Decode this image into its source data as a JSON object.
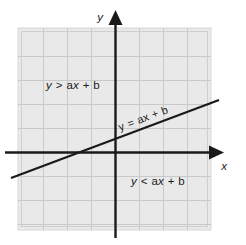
{
  "figure": {
    "background_color": "#ffffff",
    "plot_area": {
      "fill_color": "#e9e9e9",
      "grid_color": "#c9c9c9",
      "border_color": "#d2d2d2",
      "grid_columns": 8,
      "grid_rows": 8,
      "cell_size_px": 24
    },
    "axes": {
      "color": "#1a1a1a",
      "x_axis_label": "x",
      "y_axis_label": "y",
      "origin_px": {
        "x": 115,
        "y": 152
      },
      "x_axis_arrow": "right-arrow-icon",
      "y_axis_arrow": "up-arrow-icon"
    },
    "line": {
      "color": "#1a1a1a",
      "label": "y = ax + b",
      "equation_parts": {
        "lhs": "y",
        "relation": "=",
        "slope_term": "ax",
        "plus": "+",
        "intercept": "b"
      },
      "start_px": {
        "x": 11,
        "y": 178
      },
      "end_px": {
        "x": 219,
        "y": 100
      },
      "slope_sign": "positive",
      "label_rotation_deg": -20.5
    },
    "regions": [
      {
        "id": "above-line",
        "label": "y > ax + b",
        "parts": {
          "lhs": "y",
          "relation": ">",
          "slope_term": "ax",
          "plus": "+",
          "intercept": "b"
        },
        "position_px": {
          "x": 46,
          "y": 85
        },
        "description": "upper-left region above the line"
      },
      {
        "id": "below-line",
        "label": "y < ax + b",
        "parts": {
          "lhs": "y",
          "relation": "<",
          "slope_term": "ax",
          "plus": "+",
          "intercept": "b"
        },
        "position_px": {
          "x": 131,
          "y": 181
        },
        "description": "lower-right region below the line"
      }
    ]
  }
}
